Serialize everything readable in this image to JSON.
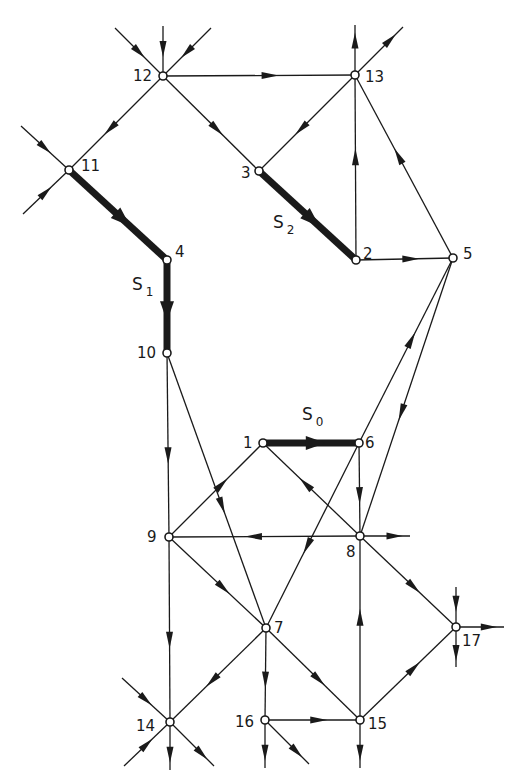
{
  "diagram": {
    "type": "directed-graph",
    "stroke_color": "#1a1a1a",
    "background": "#ffffff",
    "nodes": [
      {
        "id": "1",
        "x": 263,
        "y": 443,
        "label": "1",
        "lx": -20,
        "ly": 0
      },
      {
        "id": "2",
        "x": 356,
        "y": 260,
        "label": "2",
        "lx": 7,
        "ly": -6
      },
      {
        "id": "3",
        "x": 259,
        "y": 171,
        "label": "3",
        "lx": -18,
        "ly": 2
      },
      {
        "id": "4",
        "x": 167,
        "y": 260,
        "label": "4",
        "lx": 8,
        "ly": -8
      },
      {
        "id": "5",
        "x": 453,
        "y": 258,
        "label": "5",
        "lx": 10,
        "ly": -4
      },
      {
        "id": "6",
        "x": 359,
        "y": 443,
        "label": "6",
        "lx": 6,
        "ly": 0
      },
      {
        "id": "7",
        "x": 266,
        "y": 628,
        "label": "7",
        "lx": 8,
        "ly": 0
      },
      {
        "id": "8",
        "x": 360,
        "y": 536,
        "label": "8",
        "lx": -14,
        "ly": 16
      },
      {
        "id": "9",
        "x": 169,
        "y": 537,
        "label": "9",
        "lx": -22,
        "ly": 0
      },
      {
        "id": "10",
        "x": 167,
        "y": 353,
        "label": "10",
        "lx": -30,
        "ly": 0
      },
      {
        "id": "11",
        "x": 69,
        "y": 170,
        "label": "11",
        "lx": 12,
        "ly": -4
      },
      {
        "id": "12",
        "x": 163,
        "y": 76,
        "label": "12",
        "lx": -30,
        "ly": 0
      },
      {
        "id": "13",
        "x": 355,
        "y": 75,
        "label": "13",
        "lx": 10,
        "ly": 2
      },
      {
        "id": "14",
        "x": 170,
        "y": 722,
        "label": "14",
        "lx": -34,
        "ly": 4
      },
      {
        "id": "15",
        "x": 360,
        "y": 720,
        "label": "15",
        "lx": 8,
        "ly": 4
      },
      {
        "id": "16",
        "x": 265,
        "y": 720,
        "label": "16",
        "lx": -30,
        "ly": 2
      },
      {
        "id": "17",
        "x": 456,
        "y": 627,
        "label": "17",
        "lx": 6,
        "ly": 14
      }
    ],
    "edges": [
      {
        "from": "12",
        "to": "13",
        "bold": false
      },
      {
        "from": "12",
        "to": "11",
        "bold": false
      },
      {
        "from": "12",
        "to": "3",
        "bold": false
      },
      {
        "from": "13",
        "to": "3",
        "bold": false
      },
      {
        "from": "2",
        "to": "13",
        "bold": false
      },
      {
        "from": "5",
        "to": "13",
        "bold": false
      },
      {
        "from": "2",
        "to": "5",
        "bold": false
      },
      {
        "from": "11",
        "to": "4",
        "bold": true
      },
      {
        "from": "4",
        "to": "10",
        "bold": true
      },
      {
        "from": "3",
        "to": "2",
        "bold": true
      },
      {
        "from": "1",
        "to": "6",
        "bold": true
      },
      {
        "from": "10",
        "to": "9",
        "bold": false
      },
      {
        "from": "10",
        "to": "7",
        "bold": false
      },
      {
        "from": "6",
        "to": "5",
        "bold": false
      },
      {
        "from": "5",
        "to": "8",
        "bold": false
      },
      {
        "from": "6",
        "to": "8",
        "bold": false
      },
      {
        "from": "8",
        "to": "1",
        "bold": false
      },
      {
        "from": "9",
        "to": "1",
        "bold": false
      },
      {
        "from": "8",
        "to": "9",
        "bold": false
      },
      {
        "from": "6",
        "to": "7",
        "bold": false
      },
      {
        "from": "9",
        "to": "7",
        "bold": false
      },
      {
        "from": "9",
        "to": "14",
        "bold": false
      },
      {
        "from": "8",
        "to": "17",
        "bold": false
      },
      {
        "from": "15",
        "to": "8",
        "bold": false
      },
      {
        "from": "7",
        "to": "14",
        "bold": false
      },
      {
        "from": "7",
        "to": "16",
        "bold": false
      },
      {
        "from": "7",
        "to": "15",
        "bold": false
      },
      {
        "from": "16",
        "to": "15",
        "bold": false
      },
      {
        "from": "15",
        "to": "17",
        "bold": false
      }
    ],
    "stubs": [
      {
        "node": "12",
        "dx": -48,
        "dy": -48,
        "dir": "in"
      },
      {
        "node": "12",
        "dx": 0,
        "dy": -50,
        "dir": "in"
      },
      {
        "node": "12",
        "dx": 48,
        "dy": -48,
        "dir": "in"
      },
      {
        "node": "13",
        "dx": 0,
        "dy": -50,
        "dir": "out"
      },
      {
        "node": "13",
        "dx": 48,
        "dy": -48,
        "dir": "out"
      },
      {
        "node": "11",
        "dx": -48,
        "dy": -44,
        "dir": "in"
      },
      {
        "node": "11",
        "dx": -46,
        "dy": 44,
        "dir": "in"
      },
      {
        "node": "8",
        "dx": 50,
        "dy": 0,
        "dir": "out"
      },
      {
        "node": "17",
        "dx": 0,
        "dy": -40,
        "dir": "in"
      },
      {
        "node": "17",
        "dx": 48,
        "dy": 0,
        "dir": "out"
      },
      {
        "node": "17",
        "dx": 0,
        "dy": 40,
        "dir": "out"
      },
      {
        "node": "14",
        "dx": -48,
        "dy": -44,
        "dir": "in"
      },
      {
        "node": "14",
        "dx": -46,
        "dy": 44,
        "dir": "in"
      },
      {
        "node": "14",
        "dx": 0,
        "dy": 48,
        "dir": "out"
      },
      {
        "node": "14",
        "dx": 44,
        "dy": 44,
        "dir": "out"
      },
      {
        "node": "16",
        "dx": 0,
        "dy": 48,
        "dir": "out"
      },
      {
        "node": "16",
        "dx": 44,
        "dy": 44,
        "dir": "out"
      },
      {
        "node": "15",
        "dx": 0,
        "dy": 48,
        "dir": "out"
      }
    ],
    "path_labels": [
      {
        "id": "S1",
        "text": "S",
        "sub": "1",
        "x": 132,
        "y": 290
      },
      {
        "id": "S2",
        "text": "S",
        "sub": "2",
        "x": 273,
        "y": 228
      },
      {
        "id": "S0",
        "text": "S",
        "sub": "0",
        "x": 302,
        "y": 420
      }
    ]
  }
}
